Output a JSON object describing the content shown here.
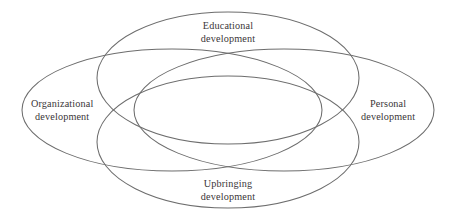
{
  "figure": {
    "type": "venn-diagram",
    "set_count": 4,
    "stroke_color": "#6d6d6d",
    "text_color": "#3a3638",
    "background_color": "#ffffff"
  },
  "sets": {
    "top": {
      "name": "educational",
      "line1": "Educational",
      "line2": "development"
    },
    "left": {
      "name": "organizational",
      "line1": "Organizational",
      "line2": "development"
    },
    "right": {
      "name": "personal",
      "line1": "Personal",
      "line2": "development"
    },
    "bottom": {
      "name": "upbringing",
      "line1": "Upbringing",
      "line2": "development"
    }
  }
}
